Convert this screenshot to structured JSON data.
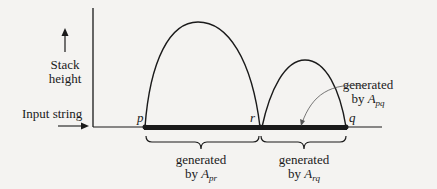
{
  "axis": {
    "y_label_line1": "Stack",
    "y_label_line2": "height",
    "x_label": "Input string"
  },
  "points": {
    "p": "p",
    "r": "r",
    "q": "q"
  },
  "annotations": {
    "pq": {
      "line1": "generated",
      "by": "by ",
      "var": "A",
      "sub": "pq"
    },
    "pr": {
      "line1": "generated",
      "by": "by ",
      "var": "A",
      "sub": "pr"
    },
    "rq": {
      "line1": "generated",
      "by": "by ",
      "var": "A",
      "sub": "rq"
    }
  },
  "colors": {
    "ink": "#1a1a1a",
    "background": "#f4f3f1",
    "thin": "#555555"
  }
}
